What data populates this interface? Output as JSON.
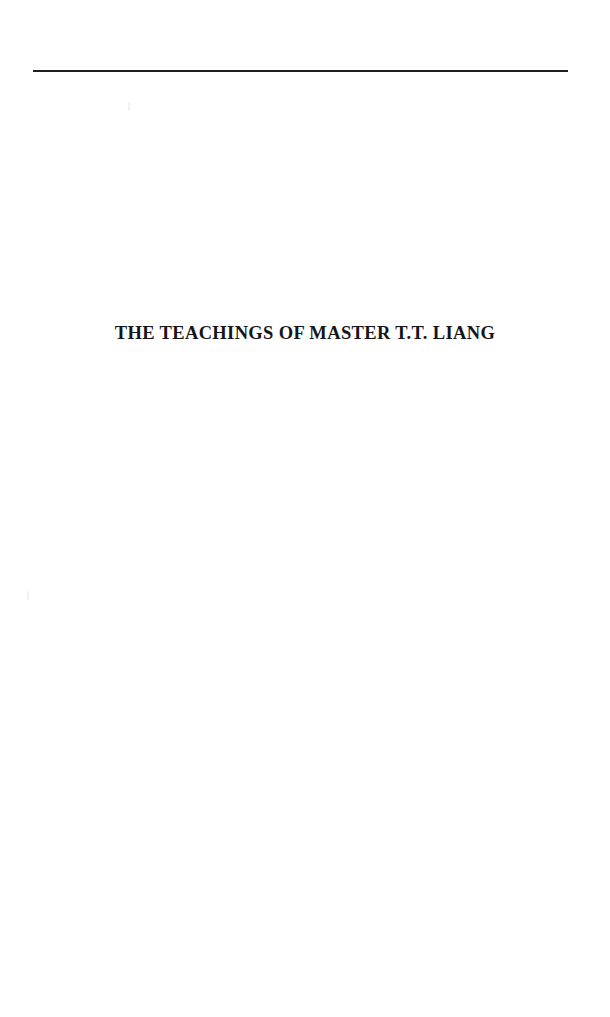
{
  "page": {
    "kind": "part-title-page",
    "background_color": "#ffffff",
    "width": 610,
    "height": 1017
  },
  "rule": {
    "name": "top-horizontal-rule",
    "color": "#1f1f1f",
    "thickness_px": 2,
    "left_px": 33,
    "right_px": 568,
    "top_px": 70
  },
  "heading": {
    "text": "THE TEACHINGS OF MASTER T.T. LIANG",
    "color": "#14161a",
    "style": "bold-small-caps-serif",
    "alignment": "center"
  },
  "artifacts": {
    "speck_upper": "scan-speck",
    "speck_lower": "scan-speck"
  }
}
